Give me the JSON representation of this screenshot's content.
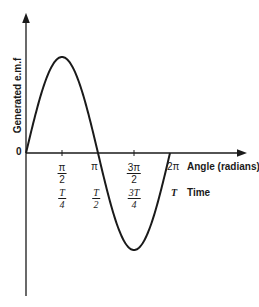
{
  "chart_data": {
    "type": "line",
    "title": "",
    "xlabel": "Angle (radians)",
    "xlabel_secondary": "Time",
    "ylabel": "Generated e.m.f",
    "origin_label": "0",
    "x_ticks_angle": [
      "π/2",
      "π",
      "3π/2",
      "2π"
    ],
    "x_ticks_time": [
      "T/4",
      "T/2",
      "3T/4",
      "T"
    ],
    "x": [
      0,
      1.5708,
      3.1416,
      4.7124,
      6.2832
    ],
    "values": [
      0,
      1,
      0,
      -1,
      0
    ],
    "series": [
      {
        "name": "e.m.f (sine wave)",
        "values": [
          0,
          1,
          0,
          -1,
          0
        ]
      }
    ],
    "grid": false,
    "legend": "none"
  },
  "labels": {
    "ylabel": "Generated e.m.f",
    "origin": "0",
    "angle_axis": "Angle (radians)",
    "time_axis": "Time",
    "tick_pi_half_num": "π",
    "tick_pi_half_den": "2",
    "tick_pi": "π",
    "tick_3pi_half_num": "3π",
    "tick_3pi_half_den": "2",
    "tick_2pi": "2π",
    "tick_t4_num": "T",
    "tick_t4_den": "4",
    "tick_t2_num": "T",
    "tick_t2_den": "2",
    "tick_3t4_num": "3T",
    "tick_3t4_den": "4",
    "tick_t": "T"
  }
}
